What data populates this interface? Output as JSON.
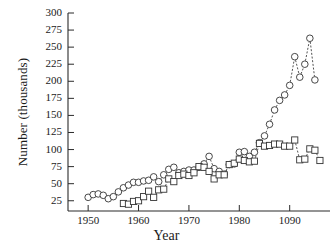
{
  "chart_data": {
    "type": "scatter",
    "title": "",
    "xlabel": "Year",
    "ylabel": "Number (thousands)",
    "xlim": [
      1946,
      1998
    ],
    "ylim": [
      10,
      300
    ],
    "grid": false,
    "legend": "none",
    "xticks": [
      1950,
      1960,
      1970,
      1980,
      1990
    ],
    "xtick_labels": [
      "1950",
      "1960",
      "1970",
      "1980",
      "1090"
    ],
    "yticks": [
      25,
      50,
      75,
      100,
      125,
      150,
      175,
      200,
      225,
      250,
      275,
      300
    ],
    "ytick_labels": [
      "25",
      "50",
      "75",
      "100",
      "125",
      "150",
      "175",
      "200",
      "225",
      "250",
      "275",
      "300"
    ],
    "series": [
      {
        "name": "circles",
        "marker": "open-circle",
        "line": "dashed",
        "color": "#333333",
        "points": [
          {
            "x": 1950,
            "y": 30
          },
          {
            "x": 1951,
            "y": 34
          },
          {
            "x": 1952,
            "y": 35
          },
          {
            "x": 1953,
            "y": 33
          },
          {
            "x": 1954,
            "y": 28
          },
          {
            "x": 1955,
            "y": 31
          },
          {
            "x": 1956,
            "y": 38
          },
          {
            "x": 1957,
            "y": 44
          },
          {
            "x": 1958,
            "y": 48
          },
          {
            "x": 1959,
            "y": 52
          },
          {
            "x": 1960,
            "y": 52
          },
          {
            "x": 1961,
            "y": 54
          },
          {
            "x": 1962,
            "y": 55
          },
          {
            "x": 1963,
            "y": 60
          },
          {
            "x": 1964,
            "y": 53
          },
          {
            "x": 1965,
            "y": 63
          },
          {
            "x": 1966,
            "y": 71
          },
          {
            "x": 1967,
            "y": 74
          },
          {
            "x": 1968,
            "y": 66
          },
          {
            "x": 1969,
            "y": 68
          },
          {
            "x": 1970,
            "y": 70
          },
          {
            "x": 1971,
            "y": 70
          },
          {
            "x": 1972,
            "y": 74
          },
          {
            "x": 1973,
            "y": 79
          },
          {
            "x": 1974,
            "y": 90
          },
          {
            "x": 1975,
            "y": 72
          },
          {
            "x": 1976,
            "y": 68
          },
          {
            "x": 1977,
            "y": 64
          },
          {
            "x": 1978,
            "y": 78
          },
          {
            "x": 1979,
            "y": 79
          },
          {
            "x": 1980,
            "y": 96
          },
          {
            "x": 1981,
            "y": 97
          },
          {
            "x": 1982,
            "y": 90
          },
          {
            "x": 1983,
            "y": 96
          },
          {
            "x": 1984,
            "y": 110
          },
          {
            "x": 1985,
            "y": 120
          },
          {
            "x": 1986,
            "y": 137
          },
          {
            "x": 1987,
            "y": 158
          },
          {
            "x": 1988,
            "y": 172
          },
          {
            "x": 1989,
            "y": 180
          },
          {
            "x": 1990,
            "y": 194
          },
          {
            "x": 1991,
            "y": 236
          },
          {
            "x": 1992,
            "y": 206
          },
          {
            "x": 1993,
            "y": 225
          },
          {
            "x": 1994,
            "y": 263
          },
          {
            "x": 1995,
            "y": 202
          }
        ]
      },
      {
        "name": "squares",
        "marker": "open-square",
        "line": "dashed",
        "color": "#333333",
        "points": [
          {
            "x": 1957,
            "y": 21
          },
          {
            "x": 1958,
            "y": 20
          },
          {
            "x": 1959,
            "y": 24
          },
          {
            "x": 1960,
            "y": 25
          },
          {
            "x": 1961,
            "y": 31
          },
          {
            "x": 1962,
            "y": 39
          },
          {
            "x": 1963,
            "y": 30
          },
          {
            "x": 1964,
            "y": 41
          },
          {
            "x": 1965,
            "y": 42
          },
          {
            "x": 1966,
            "y": 57
          },
          {
            "x": 1967,
            "y": 53
          },
          {
            "x": 1968,
            "y": 62
          },
          {
            "x": 1969,
            "y": 64
          },
          {
            "x": 1970,
            "y": 62
          },
          {
            "x": 1971,
            "y": 66
          },
          {
            "x": 1972,
            "y": 75
          },
          {
            "x": 1973,
            "y": 74
          },
          {
            "x": 1974,
            "y": 68
          },
          {
            "x": 1975,
            "y": 57
          },
          {
            "x": 1976,
            "y": 63
          },
          {
            "x": 1977,
            "y": 63
          },
          {
            "x": 1978,
            "y": 78
          },
          {
            "x": 1979,
            "y": 80
          },
          {
            "x": 1980,
            "y": 86
          },
          {
            "x": 1981,
            "y": 84
          },
          {
            "x": 1982,
            "y": 82
          },
          {
            "x": 1983,
            "y": 83
          },
          {
            "x": 1984,
            "y": 109
          },
          {
            "x": 1985,
            "y": 105
          },
          {
            "x": 1986,
            "y": 106
          },
          {
            "x": 1987,
            "y": 108
          },
          {
            "x": 1988,
            "y": 108
          },
          {
            "x": 1989,
            "y": 105
          },
          {
            "x": 1990,
            "y": 105
          },
          {
            "x": 1991,
            "y": 114
          },
          {
            "x": 1992,
            "y": 85
          },
          {
            "x": 1993,
            "y": 86
          },
          {
            "x": 1994,
            "y": 101
          },
          {
            "x": 1995,
            "y": 99
          },
          {
            "x": 1996,
            "y": 84
          }
        ]
      }
    ]
  },
  "axes": {
    "y_axis_label": "Number (thousands)",
    "x_axis_label": "Year"
  }
}
